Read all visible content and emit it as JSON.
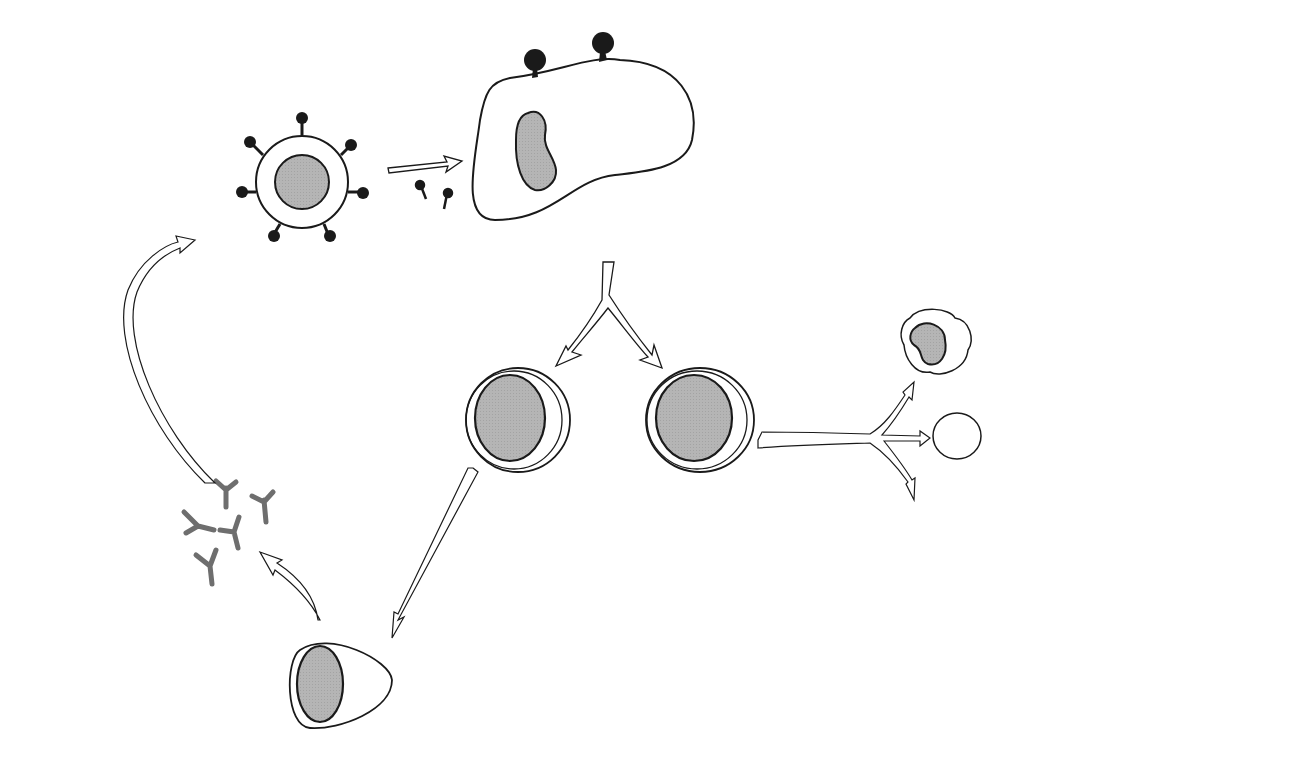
{
  "diagram": {
    "type": "immune response to tumor cell flow diagram",
    "colors": {
      "outline": "#1a1a1a",
      "nucleus_fill": "#b3b3b3",
      "antigen": "#1a1a1a",
      "antibody": "#6e6e6e",
      "background": "#ffffff"
    },
    "labels": {
      "processed_antigen": "Processed tumor antigen",
      "apc": "Antigen presenting cell (APC)",
      "tumor_cell": "Tumor cell",
      "antigen_shed_1": "Antigen",
      "antigen_shed_2": "shed",
      "bt_stim_1": "B and T cell",
      "bt_stim_2": "stimulation",
      "adcc": "ADCC reactions",
      "b_cell": "B cell",
      "t_cell": "T cell",
      "lymphokine_1": "Lymphokine",
      "lymphokine_2": "release",
      "macrophage": "Macrophage",
      "nk_cell": "NK cell",
      "tc_main": "T",
      "tc_sub": "C",
      "attack_1": "Attack",
      "attack_2": "tumor",
      "attack_3": "cell",
      "antibody_1": "Tumor-specific",
      "antibody_2": "antibody",
      "plasma_cell": "Plasma cell"
    },
    "nodes": [
      "Tumor cell",
      "Antigen presenting cell (APC)",
      "B cell",
      "T cell",
      "Plasma cell",
      "Tumor-specific antibody",
      "Macrophage",
      "NK cell",
      "Tc",
      "Tumor cell (target)"
    ],
    "edges": [
      {
        "from": "Tumor cell",
        "to": "APC",
        "label": "Antigen shed"
      },
      {
        "from": "APC",
        "to": "B cell",
        "label": "B and T cell stimulation"
      },
      {
        "from": "APC",
        "to": "T cell",
        "label": "B and T cell stimulation"
      },
      {
        "from": "B cell",
        "to": "Plasma cell"
      },
      {
        "from": "Plasma cell",
        "to": "Tumor-specific antibody"
      },
      {
        "from": "Tumor-specific antibody",
        "to": "Tumor cell",
        "label": "ADCC reactions"
      },
      {
        "from": "T cell",
        "to": "Macrophage",
        "label": "Lymphokine release"
      },
      {
        "from": "T cell",
        "to": "NK cell",
        "label": "Lymphokine release"
      },
      {
        "from": "T cell",
        "to": "Tc",
        "label": "Lymphokine release"
      },
      {
        "from": "Macrophage/NK cell/Tc",
        "to": "Tumor cell (target)",
        "label": "Attack tumor cell"
      }
    ]
  }
}
